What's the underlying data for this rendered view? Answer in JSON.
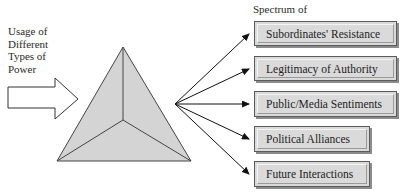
{
  "left_label": {
    "lines": [
      "Usage of",
      "Different",
      "Types of",
      "Power"
    ]
  },
  "spectrum_label": "Spectrum of",
  "outcomes": [
    {
      "label": "Subordinates' Resistance"
    },
    {
      "label": "Legitimacy of Authority"
    },
    {
      "label": "Public/Media Sentiments"
    },
    {
      "label": "Political Alliances"
    },
    {
      "label": "Future Interactions"
    }
  ],
  "shapes": {
    "input_arrow": "block-arrow-right",
    "center": "pyramid-triangle",
    "connectors": "five-arrows-fan-out"
  },
  "colors": {
    "triangle_fill": "#d4d4d4",
    "box_fill": "#dadada",
    "stroke": "#333333",
    "shadow": "#8c8c8c"
  }
}
